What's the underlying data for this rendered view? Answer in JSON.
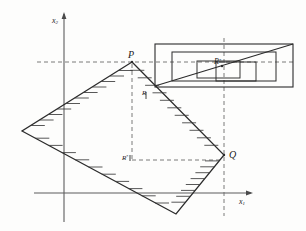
{
  "figure": {
    "kind": "geometry-diagram",
    "background_color": "#fdfdfc",
    "ink_color": "#2b2b2b",
    "dash_color": "#555555"
  },
  "axes": {
    "x_axis": {
      "label_main": "x",
      "label_sub": "1",
      "arrow": true
    },
    "y_axis": {
      "label_main": "x",
      "label_sub": "2",
      "arrow": true
    },
    "origin_label": ""
  },
  "points": [
    {
      "id": "P",
      "label_main": "P",
      "label_sup": "",
      "x": 132,
      "y": 62
    },
    {
      "id": "Q",
      "label_main": "Q",
      "label_sup": "",
      "x": 224,
      "y": 155
    },
    {
      "id": "R",
      "label_main": "R",
      "label_sup": "",
      "x": 148,
      "y": 96
    },
    {
      "id": "Rp",
      "label_main": "R",
      "label_sup": "*",
      "x": 125,
      "y": 160
    },
    {
      "id": "Rs",
      "label_main": "R",
      "label_sup": "*",
      "x": 221,
      "y": 64
    }
  ],
  "shape": {
    "name": "hatched-rhombus",
    "vertices": [
      [
        132,
        62
      ],
      [
        224,
        155
      ],
      [
        176,
        214
      ],
      [
        22,
        131
      ]
    ],
    "hatching": true
  },
  "inset": {
    "name": "detail-box",
    "outer": [
      155,
      44,
      138,
      43
    ],
    "middle": [
      172,
      52,
      104,
      29
    ],
    "inner_left": [
      197,
      61,
      43,
      17
    ],
    "inner_right": [
      216,
      62,
      40,
      19
    ],
    "diagonal": true
  },
  "dashed_lines": {
    "horizontal_through_P": true,
    "vertical_through_Q": true,
    "vertical_from_P": true,
    "horizontal_from_Rstar": true
  }
}
